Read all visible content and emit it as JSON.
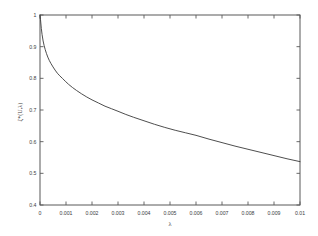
{
  "chart_data": {
    "type": "line",
    "title": "",
    "subtitle": "",
    "xlabel": "λ",
    "ylabel": "ζ*(U,λ)",
    "xlim": [
      0,
      0.01
    ],
    "ylim": [
      0.4,
      1.0
    ],
    "grid": false,
    "legend": null,
    "legend_position": "none",
    "box": true,
    "ticks_direction": "in",
    "ticks_all_sides": true,
    "xticks": [
      0,
      0.001,
      0.002,
      0.003,
      0.004,
      0.005,
      0.006,
      0.007,
      0.008,
      0.009,
      0.01
    ],
    "xticklabels": [
      "0",
      "0.001",
      "0.002",
      "0.003",
      "0.004",
      "0.005",
      "0.006",
      "0.007",
      "0.008",
      "0.009",
      "0.01"
    ],
    "yticks": [
      0.4,
      0.5,
      0.6,
      0.7,
      0.8,
      0.9,
      1.0
    ],
    "yticklabels": [
      "0.4",
      "0.5",
      "0.6",
      "0.7",
      "0.8",
      "0.9",
      "1"
    ],
    "series": [
      {
        "name": "ζ*(U,λ)",
        "color": "#3a3a3a",
        "x": [
          0.0,
          2e-05,
          5e-05,
          8e-05,
          0.00012,
          0.00016,
          0.0002,
          0.00025,
          0.0003,
          0.00036,
          0.00042,
          0.0005,
          0.00058,
          0.00067,
          0.00076,
          0.00086,
          0.00097,
          0.0011,
          0.00125,
          0.0014,
          0.0016,
          0.0018,
          0.002,
          0.00225,
          0.0025,
          0.00275,
          0.003,
          0.0033,
          0.0036,
          0.004,
          0.0044,
          0.0048,
          0.0052,
          0.0056,
          0.006,
          0.0065,
          0.007,
          0.0075,
          0.008,
          0.0085,
          0.009,
          0.0095,
          0.01
        ],
        "y": [
          1.0,
          0.985,
          0.958,
          0.938,
          0.918,
          0.903,
          0.891,
          0.878,
          0.867,
          0.856,
          0.847,
          0.836,
          0.826,
          0.816,
          0.808,
          0.8,
          0.791,
          0.781,
          0.771,
          0.762,
          0.751,
          0.741,
          0.732,
          0.722,
          0.712,
          0.704,
          0.696,
          0.686,
          0.677,
          0.666,
          0.655,
          0.645,
          0.636,
          0.628,
          0.62,
          0.608,
          0.597,
          0.586,
          0.576,
          0.566,
          0.556,
          0.546,
          0.537
        ]
      }
    ]
  },
  "axes": {
    "x_axis_label": "λ",
    "y_axis_label": "ζ*(U,λ)"
  },
  "colors": {
    "curve": "#3a3a3a",
    "axis": "#595959",
    "text": "#3d3d3d",
    "background": "#ffffff"
  }
}
